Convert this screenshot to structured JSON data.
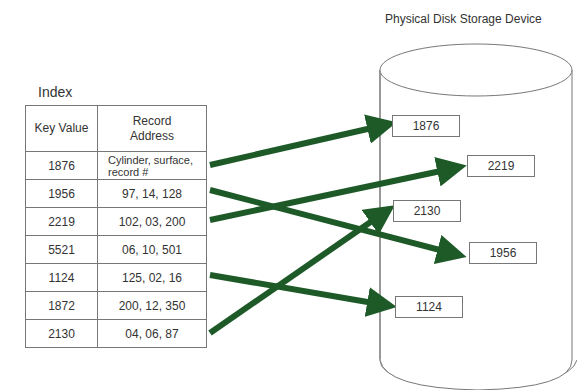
{
  "index": {
    "title": "Index",
    "headers": [
      "Key Value",
      "Record Address"
    ],
    "rows": [
      {
        "key": "1876",
        "address": "Cylinder, surface, record #"
      },
      {
        "key": "1956",
        "address": "97, 14, 128"
      },
      {
        "key": "2219",
        "address": "102, 03, 200"
      },
      {
        "key": "5521",
        "address": "06, 10, 501"
      },
      {
        "key": "1124",
        "address": "125, 02, 16"
      },
      {
        "key": "1872",
        "address": "200, 12, 350"
      },
      {
        "key": "2130",
        "address": "04, 06, 87"
      }
    ]
  },
  "device": {
    "title": "Physical Disk Storage Device",
    "records": [
      "1876",
      "2219",
      "2130",
      "1956",
      "1124"
    ]
  },
  "colors": {
    "arrow": "#1e5a28",
    "border": "#777777"
  }
}
